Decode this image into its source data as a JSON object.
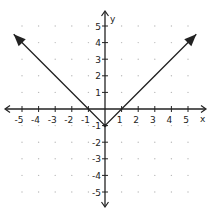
{
  "chart_data": {
    "type": "line",
    "title": "",
    "function": "y = |x| - 1",
    "xlabel": "x",
    "ylabel": "y",
    "xlim": [
      -5,
      5
    ],
    "ylim": [
      -5,
      5
    ],
    "grid": "dots",
    "x_tick_labels": [
      "-5",
      "-4",
      "-3",
      "-2",
      "-1",
      "1",
      "2",
      "3",
      "4",
      "5"
    ],
    "y_tick_labels": [
      "5",
      "4",
      "3",
      "2",
      "1",
      "-1",
      "-2",
      "-3",
      "-4",
      "-5"
    ],
    "series": [
      {
        "name": "y = |x| - 1",
        "x": [
          -5.5,
          -1,
          0,
          1,
          5.5
        ],
        "y": [
          4.5,
          0,
          -1,
          0,
          4.5
        ],
        "arrows": "both ends"
      }
    ],
    "vertex": [
      0,
      -1
    ],
    "x_intercepts": [
      -1,
      1
    ],
    "color": "#222222"
  },
  "axes": {
    "x_label": "x",
    "y_label": "y"
  },
  "style": {
    "line_color": "#222222",
    "grid_dot_color": "#bbbbbb",
    "axis_color": "#222222"
  }
}
